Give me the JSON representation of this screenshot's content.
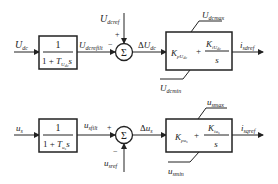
{
  "diagram": {
    "type": "control-block-diagram",
    "loops": [
      {
        "id": "dc-voltage-loop",
        "input": {
          "symbol": "U",
          "sub": "dc"
        },
        "filter": {
          "numerator": "1",
          "denominator_prefix": "1 + ",
          "T_symbol": "T",
          "T_sub": "U",
          "T_subsub": "dc",
          "s": "s"
        },
        "filtered_signal": {
          "symbol": "U",
          "sub": "dcrefilt"
        },
        "reference": {
          "symbol": "U",
          "sub": "dcref",
          "sign": "+"
        },
        "feedback_sign": "−",
        "sum_symbol": "Σ",
        "error": {
          "prefix": "Δ",
          "symbol": "U",
          "sub": "dc"
        },
        "pi": {
          "kp": "K",
          "kp_sub": "pU",
          "kp_subsub": "dc",
          "plus": "+",
          "ki": "K",
          "ki_sub": "iU",
          "ki_subsub": "dc",
          "s": "s"
        },
        "limit_max": {
          "symbol": "U",
          "sub": "dcmax"
        },
        "limit_min": {
          "symbol": "U",
          "sub": "dcmin"
        },
        "output": {
          "symbol": "i",
          "sub": "sdref"
        }
      },
      {
        "id": "ac-voltage-loop",
        "input": {
          "symbol": "u",
          "sub": "s"
        },
        "filter": {
          "numerator": "1",
          "denominator_prefix": "1 + ",
          "T_symbol": "T",
          "T_sub": "u",
          "T_subsub": "s",
          "s": "s"
        },
        "filtered_signal": {
          "symbol": "u",
          "sub": "sfilt"
        },
        "feedback_sign": "+",
        "reference": {
          "symbol": "u",
          "sub": "sref",
          "sign": "−"
        },
        "sum_symbol": "Σ",
        "error": {
          "prefix": "Δ",
          "symbol": "u",
          "sub": "s"
        },
        "pi": {
          "kp": "K",
          "kp_sub": "pu",
          "kp_subsub": "s",
          "plus": "+",
          "ki": "K",
          "ki_sub": "iu",
          "ki_subsub": "s",
          "s": "s"
        },
        "limit_max": {
          "symbol": "u",
          "sub": "smax"
        },
        "limit_min": {
          "symbol": "u",
          "sub": "smin"
        },
        "output": {
          "symbol": "i",
          "sub": "sqref"
        }
      }
    ]
  }
}
